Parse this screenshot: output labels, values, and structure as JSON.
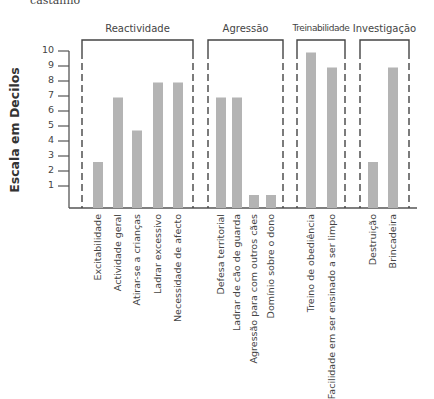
{
  "header": {
    "cut_text": "castanho"
  },
  "chart_data": {
    "type": "bar",
    "title": "",
    "xlabel": "",
    "ylabel": "Escala em Decilos",
    "ylim": [
      0,
      10
    ],
    "yticks": [
      1,
      2,
      3,
      4,
      5,
      6,
      7,
      8,
      9,
      10
    ],
    "grid": false,
    "bar_color": "#b4b4b4",
    "groups": [
      {
        "name": "Reactividade",
        "categories": [
          "Excitabilidade",
          "Actividade geral",
          "Atirar-se a crianças",
          "Ladrar  excessivo",
          "Necessidade de afecto"
        ],
        "values": [
          2.6,
          6.9,
          4.7,
          7.9,
          7.9
        ]
      },
      {
        "name": "Agressão",
        "categories": [
          "Defesa territorial",
          "Ladrar de cão de guarda",
          "Agressão para com outros cães",
          "Domínio sobre o dono"
        ],
        "values": [
          6.9,
          6.9,
          0.4,
          0.4
        ]
      },
      {
        "name": "Treinabilidade",
        "categories": [
          "Treino de obediência",
          "Facilidade em ser ensinado a ser limpo"
        ],
        "values": [
          9.9,
          8.9
        ]
      },
      {
        "name": "Investigação",
        "categories": [
          "Destruição",
          "Brincadeira"
        ],
        "values": [
          2.6,
          8.9
        ]
      }
    ],
    "categories": [
      "Excitabilidade",
      "Actividade geral",
      "Atirar-se a crianças",
      "Ladrar  excessivo",
      "Necessidade de afecto",
      "Defesa territorial",
      "Ladrar de cão de guarda",
      "Agressão para com outros cães",
      "Domínio sobre o dono",
      "Treino de obediência",
      "Facilidade em ser ensinado a ser limpo",
      "Destruição",
      "Brincadeira"
    ],
    "values": [
      2.6,
      6.9,
      4.7,
      7.9,
      7.9,
      6.9,
      6.9,
      0.4,
      0.4,
      9.9,
      8.9,
      2.6,
      8.9
    ]
  }
}
